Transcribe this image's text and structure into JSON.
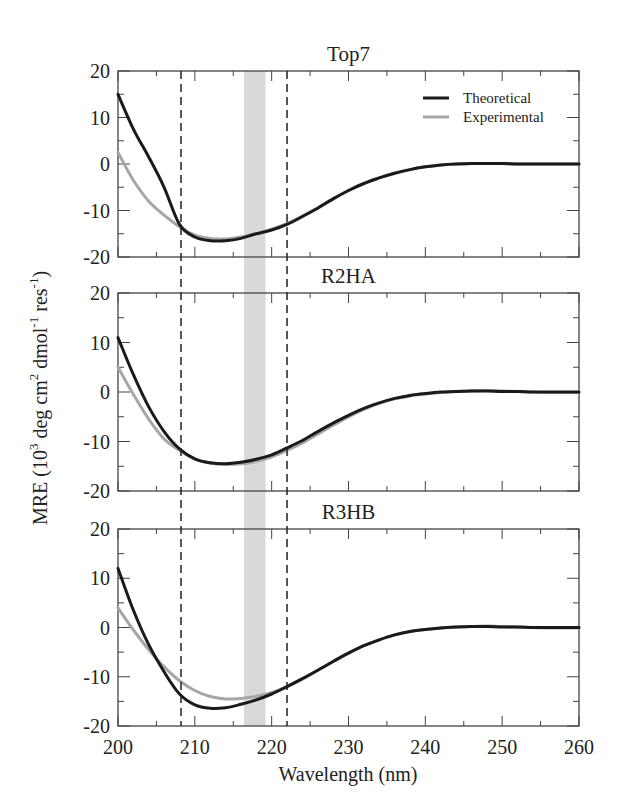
{
  "chart_data": {
    "type": "line",
    "layout": "three vertically stacked panels sharing x-axis",
    "xlabel": "Wavelength (nm)",
    "ylabel": "MRE (10^3 deg cm^2 dmol^-1 res^-1)",
    "ylabel_parts": {
      "main": "MRE (10",
      "sup1": "3",
      "mid1": " deg cm",
      "sup2": "2",
      "mid2": " dmol",
      "sup3": "-1",
      "mid3": " res",
      "sup4": "-1",
      "end": ")"
    },
    "xlim": [
      200,
      260
    ],
    "ylim": [
      -20,
      20
    ],
    "x_ticks": [
      200,
      210,
      220,
      230,
      240,
      250,
      260
    ],
    "y_ticks": [
      20,
      10,
      0,
      -10,
      -20
    ],
    "grid": false,
    "legend": {
      "position": "upper right of top panel",
      "entries": [
        "Theoretical",
        "Experimental"
      ]
    },
    "series_styles": {
      "Theoretical": {
        "color": "#1a1a1a",
        "width": 3
      },
      "Experimental": {
        "color": "#a6a6a6",
        "width": 3
      }
    },
    "annotations": {
      "dashed_vlines": [
        208.2,
        222
      ],
      "shaded_band": {
        "from": 216.4,
        "to": 219.2,
        "color": "#d9d9d9"
      }
    },
    "x": [
      200,
      202,
      204,
      206,
      208,
      210,
      212,
      214,
      216,
      218,
      220,
      222,
      224,
      226,
      228,
      230,
      232,
      234,
      236,
      238,
      240,
      242,
      244,
      246,
      248,
      250,
      252,
      254,
      256,
      258,
      260
    ],
    "panels": [
      {
        "title": "Top7",
        "series": [
          {
            "name": "Theoretical",
            "values": [
              15,
              7.5,
              1.5,
              -5,
              -13,
              -15.7,
              -16.5,
              -16.5,
              -16,
              -15,
              -14.2,
              -13,
              -11.3,
              -9.5,
              -7.5,
              -5.7,
              -4.2,
              -3,
              -2,
              -1.2,
              -0.6,
              -0.2,
              0,
              0.1,
              0.1,
              0.1,
              0,
              0,
              0,
              0,
              0
            ]
          },
          {
            "name": "Experimental",
            "values": [
              2.5,
              -3.5,
              -8,
              -11,
              -13.5,
              -15.3,
              -16,
              -16.1,
              -15.7,
              -15,
              -14,
              -12.8,
              -11.2,
              -9.4,
              -7.5,
              -5.7,
              -4.2,
              -3,
              -2,
              -1.2,
              -0.6,
              -0.2,
              0,
              0.1,
              0.1,
              0.1,
              0,
              0,
              0,
              0,
              0
            ]
          }
        ]
      },
      {
        "title": "R2HA",
        "series": [
          {
            "name": "Theoretical",
            "values": [
              11,
              3.5,
              -3,
              -8,
              -11.5,
              -13.5,
              -14.3,
              -14.5,
              -14.2,
              -13.6,
              -12.7,
              -11.3,
              -9.8,
              -8,
              -6.3,
              -4.7,
              -3.3,
              -2.2,
              -1.3,
              -0.7,
              -0.3,
              0,
              0.1,
              0.2,
              0.2,
              0.1,
              0.1,
              0,
              0,
              0,
              0
            ]
          },
          {
            "name": "Experimental",
            "values": [
              5,
              -0.5,
              -5.5,
              -9.5,
              -11.8,
              -13.5,
              -14.4,
              -14.6,
              -14.5,
              -14,
              -13.1,
              -11.8,
              -10.3,
              -8.5,
              -6.7,
              -5,
              -3.5,
              -2.3,
              -1.4,
              -0.8,
              -0.4,
              -0.1,
              0.1,
              0.2,
              0.3,
              0.2,
              0.1,
              0,
              -0.1,
              -0.1,
              -0.1
            ]
          }
        ]
      },
      {
        "title": "R3HB",
        "series": [
          {
            "name": "Theoretical",
            "values": [
              12,
              3.5,
              -3.5,
              -9,
              -13.5,
              -15.7,
              -16.4,
              -16.3,
              -15.6,
              -14.7,
              -13.5,
              -12,
              -10.4,
              -8.7,
              -6.9,
              -5.2,
              -3.7,
              -2.5,
              -1.5,
              -0.8,
              -0.4,
              -0.1,
              0.1,
              0.2,
              0.2,
              0.1,
              0.1,
              0,
              0,
              0,
              0
            ]
          },
          {
            "name": "Experimental",
            "values": [
              4,
              -0.5,
              -4.5,
              -8,
              -10.8,
              -12.8,
              -14,
              -14.5,
              -14.4,
              -14,
              -13.2,
              -12,
              -10.5,
              -8.7,
              -6.9,
              -5.2,
              -3.7,
              -2.5,
              -1.5,
              -0.8,
              -0.4,
              -0.1,
              0.1,
              0.2,
              0.3,
              0.2,
              0.1,
              0,
              -0.1,
              -0.1,
              -0.1
            ]
          }
        ]
      }
    ]
  }
}
